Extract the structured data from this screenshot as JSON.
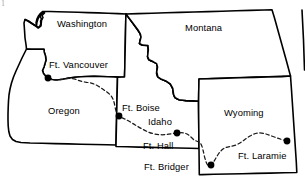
{
  "map": {
    "kind": "line-art-map",
    "title_visible": false,
    "background_color": "#ffffff",
    "line_color": "#000000",
    "trail_style": "dashed",
    "corner_artifact": "1",
    "states": [
      {
        "id": "washington",
        "label": "Washington",
        "label_x": 57,
        "label_y": 19
      },
      {
        "id": "oregon",
        "label": "Oregon",
        "label_x": 48,
        "label_y": 106
      },
      {
        "id": "idaho",
        "label": "Idaho",
        "label_x": 148,
        "label_y": 117
      },
      {
        "id": "montana",
        "label": "Montana",
        "label_x": 185,
        "label_y": 23
      },
      {
        "id": "wyoming",
        "label": "Wyoming",
        "label_x": 224,
        "label_y": 108
      }
    ],
    "forts": [
      {
        "id": "ft-vancouver",
        "label": "Ft. Vancouver",
        "dot_x": 48,
        "dot_y": 78,
        "label_x": 49,
        "label_y": 60
      },
      {
        "id": "ft-boise",
        "label": "Ft. Boise",
        "dot_x": 119,
        "dot_y": 116,
        "label_x": 122,
        "label_y": 103
      },
      {
        "id": "ft-hall",
        "label": "Ft. Hall",
        "dot_x": 177,
        "dot_y": 133,
        "label_x": 143,
        "label_y": 141
      },
      {
        "id": "ft-bridger",
        "label": "Ft. Bridger",
        "dot_x": 211,
        "dot_y": 165,
        "label_x": 144,
        "label_y": 162
      },
      {
        "id": "ft-laramie",
        "label": "Ft. Laramie",
        "dot_x": 287,
        "dot_y": 141,
        "label_x": 238,
        "label_y": 151
      }
    ],
    "trail_name": "Oregon Trail"
  }
}
